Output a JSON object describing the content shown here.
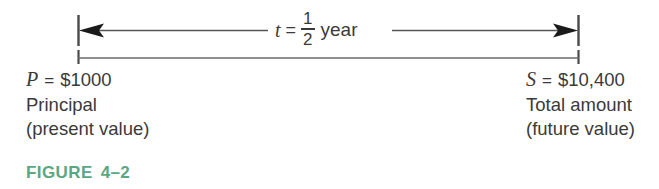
{
  "figure": {
    "caption_label": "FIGURE",
    "caption_number": "4–2",
    "caption_color": "#5aa882"
  },
  "timeline": {
    "duration": {
      "symbol": "t",
      "equals": "=",
      "fraction_numerator": "1",
      "fraction_denominator": "2",
      "unit": "year"
    },
    "line_color": "#6a6a6a",
    "arrow_color": "#1a1a1a"
  },
  "endpoints": {
    "left": {
      "symbol": "P",
      "equals": "=",
      "amount": "$1000",
      "description_line1": "Principal",
      "description_line2": "(present value)"
    },
    "right": {
      "symbol": "S",
      "equals": "=",
      "amount": "$10,400",
      "description_line1": "Total amount",
      "description_line2": "(future value)"
    }
  }
}
